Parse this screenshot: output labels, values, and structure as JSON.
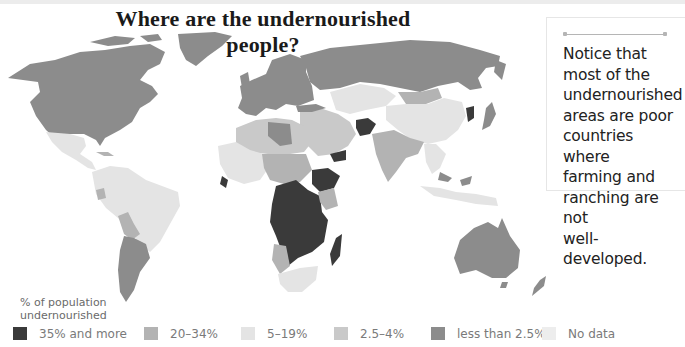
{
  "title": "Where are the undernourished people?",
  "callout": {
    "lines": [
      "Notice that",
      "most of the",
      "undernourished",
      "areas are poor",
      "countries where",
      "farming and",
      "ranching are not",
      "well-developed."
    ]
  },
  "legend": {
    "heading_line1": "% of population",
    "heading_line2": "undernourished",
    "items": [
      {
        "label": "35% and more",
        "color": "#3a3a3a"
      },
      {
        "label": "20–34%",
        "color": "#b3b3b3"
      },
      {
        "label": "5–19%",
        "color": "#e4e4e4"
      },
      {
        "label": "2.5–4%",
        "color": "#c9c9c9"
      },
      {
        "label": "less than 2.5%",
        "color": "#8c8c8c"
      },
      {
        "label": "No data",
        "color": "#ededed"
      }
    ]
  },
  "map": {
    "type": "choropleth world map",
    "regions": [
      {
        "name": "North America (USA, Canada)",
        "category": "less than 2.5%"
      },
      {
        "name": "Greenland",
        "category": "less than 2.5%"
      },
      {
        "name": "Mexico / Central America",
        "category": "5–19%"
      },
      {
        "name": "South America (north & Brazil)",
        "category": "5–19%"
      },
      {
        "name": "Bolivia / Paraguay",
        "category": "20–34%"
      },
      {
        "name": "Argentina / Chile",
        "category": "less than 2.5%"
      },
      {
        "name": "Europe",
        "category": "less than 2.5%"
      },
      {
        "name": "Russia",
        "category": "less than 2.5%"
      },
      {
        "name": "North Africa",
        "category": "2.5–4%"
      },
      {
        "name": "Libya",
        "category": "less than 2.5%"
      },
      {
        "name": "Sahel / West Africa",
        "category": "20–34%"
      },
      {
        "name": "Central & Southern Africa",
        "category": "35% and more"
      },
      {
        "name": "Ethiopia / Eritrea / Yemen",
        "category": "35% and more"
      },
      {
        "name": "Madagascar",
        "category": "35% and more"
      },
      {
        "name": "South Africa",
        "category": "5–19%"
      },
      {
        "name": "Middle East",
        "category": "2.5–4%"
      },
      {
        "name": "Afghanistan",
        "category": "35% and more"
      },
      {
        "name": "Central Asia",
        "category": "5–19%"
      },
      {
        "name": "Mongolia",
        "category": "20–34%"
      },
      {
        "name": "China",
        "category": "5–19%"
      },
      {
        "name": "North Korea",
        "category": "35% and more"
      },
      {
        "name": "Japan / South Korea",
        "category": "less than 2.5%"
      },
      {
        "name": "India / South Asia",
        "category": "20–34%"
      },
      {
        "name": "Southeast Asia",
        "category": "5–19%"
      },
      {
        "name": "Australia",
        "category": "less than 2.5%"
      },
      {
        "name": "New Zealand",
        "category": "less than 2.5%"
      }
    ]
  }
}
